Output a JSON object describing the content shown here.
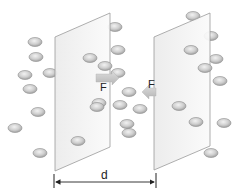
{
  "diagram": {
    "labels": {
      "force_left_plate": "F",
      "force_right_plate": "F",
      "distance": "d"
    },
    "colors": {
      "plate_fill": "#f4f4f4",
      "plate_stroke": "#9a9a9a",
      "particle_fill": "#c8c8c8",
      "particle_highlight": "#eeeeee",
      "particle_stroke": "#8e8e8e",
      "arrow_fill": "#c9c9c9",
      "dimension_line": "#222222"
    },
    "plates": [
      {
        "name": "left-plate",
        "points": [
          [
            55,
            37
          ],
          [
            110,
            13
          ],
          [
            110,
            147
          ],
          [
            55,
            171
          ]
        ]
      },
      {
        "name": "right-plate",
        "points": [
          [
            154,
            37
          ],
          [
            210,
            13
          ],
          [
            210,
            146
          ],
          [
            154,
            170
          ]
        ]
      }
    ],
    "particles_behind": [
      [
        35,
        42
      ],
      [
        36,
        57
      ],
      [
        25,
        75
      ],
      [
        50,
        73
      ],
      [
        30,
        89
      ],
      [
        38,
        112
      ],
      [
        15,
        128
      ],
      [
        40,
        153
      ],
      [
        115,
        27
      ],
      [
        118,
        50
      ],
      [
        193,
        16
      ],
      [
        211,
        36
      ],
      [
        216,
        59
      ],
      [
        220,
        81
      ],
      [
        224,
        123
      ],
      [
        211,
        153
      ],
      [
        118,
        73
      ],
      [
        129,
        92
      ],
      [
        140,
        109
      ],
      [
        129,
        133
      ]
    ],
    "particles_front": [
      [
        90,
        58
      ],
      [
        105,
        66
      ],
      [
        99,
        103
      ],
      [
        97,
        107
      ],
      [
        78,
        141
      ],
      [
        120,
        105
      ],
      [
        191,
        50
      ],
      [
        205,
        68
      ],
      [
        179,
        106
      ],
      [
        196,
        122
      ],
      [
        127,
        124
      ]
    ]
  }
}
